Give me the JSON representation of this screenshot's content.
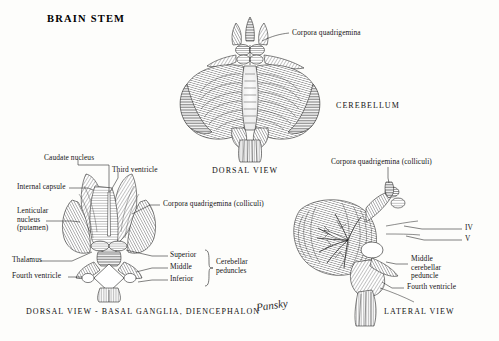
{
  "plate": {
    "title": "BRAIN  STEM",
    "signature": "Pansky",
    "ink_color": "#141414",
    "paper_color": "#fdfdfb"
  },
  "panels": [
    {
      "id": "dorsal-view",
      "caption": "DORSAL  VIEW",
      "region_label": "CEREBELLUM",
      "labels": [
        {
          "name": "corpora-quadrigemina",
          "text": "Corpora quadrigemina"
        }
      ]
    },
    {
      "id": "dorsal-basal-ganglia",
      "caption": "DORSAL  VIEW - BASAL  GANGLIA,  DIENCEPHALON",
      "labels": [
        {
          "name": "caudate-nucleus",
          "text": "Caudate nucleus"
        },
        {
          "name": "third-ventricle",
          "text": "Third ventricle"
        },
        {
          "name": "internal-capsule",
          "text": "Internal capsule"
        },
        {
          "name": "lenticular-nucleus",
          "line1": "Lenticular",
          "line2": "nucleus",
          "line3": "(putamen)"
        },
        {
          "name": "thalamus",
          "text": "Thalamus"
        },
        {
          "name": "fourth-ventricle",
          "text": "Fourth ventricle"
        },
        {
          "name": "corpora-quadrigemina-colliculi",
          "text": "Corpora quadrigemina (colliculi)"
        },
        {
          "name": "peduncle-superior",
          "text": "Superior"
        },
        {
          "name": "peduncle-middle",
          "text": "Middle"
        },
        {
          "name": "peduncle-inferior",
          "text": "Inferior"
        },
        {
          "name": "cerebellar-peduncles",
          "line1": "Cerebellar",
          "line2": "peduncles"
        }
      ]
    },
    {
      "id": "lateral-view",
      "caption": "LATERAL  VIEW",
      "labels": [
        {
          "name": "corpora-quadrigemina-colliculi",
          "text": "Corpora quadrigemina (colliculi)"
        },
        {
          "name": "cranial-nerve-iv",
          "text": "IV"
        },
        {
          "name": "cranial-nerve-v",
          "text": "V"
        },
        {
          "name": "middle-cerebellar-peduncle",
          "line1": "Middle",
          "line2": "cerebellar",
          "line3": "peduncle"
        },
        {
          "name": "fourth-ventricle",
          "text": "Fourth ventricle"
        }
      ]
    }
  ]
}
